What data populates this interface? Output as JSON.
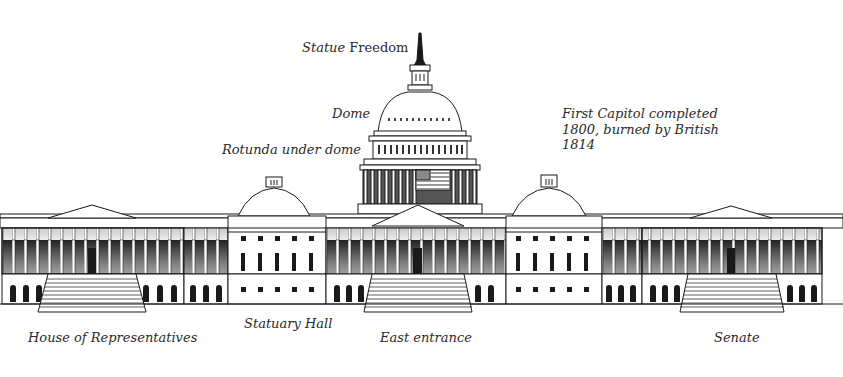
{
  "colors": {
    "ink": "#1a1a1a",
    "shade": "#bdbdbd",
    "background": "#ffffff",
    "flag_red": "#8a8a8a"
  },
  "labels": {
    "statue_freedom": {
      "italic_part": "Statue",
      "upright_part": " Freedom"
    },
    "dome": "Dome",
    "rotunda": "Rotunda under dome",
    "first_capitol": "First Capitol completed\n1800, burned by British\n1814",
    "house": "House of Representatives",
    "statuary_hall": "Statuary Hall",
    "east_entrance": "East entrance",
    "senate": "Senate"
  },
  "illustration": {
    "subject": "capitol-building-east-front",
    "parts": [
      "statue-of-freedom",
      "dome",
      "rotunda",
      "flag",
      "house-wing",
      "senate-wing",
      "statuary-hall-dome",
      "senate-side-dome",
      "east-entrance-portico",
      "steps"
    ]
  }
}
